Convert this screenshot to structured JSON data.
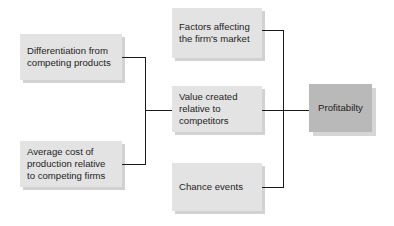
{
  "diagram": {
    "left_nodes": [
      {
        "label": "Differentiation from competing products"
      },
      {
        "label": "Average cost of production relative to competing firms"
      }
    ],
    "middle_nodes": [
      {
        "label": "Factors affecting the firm's market"
      },
      {
        "label": "Value created relative to competitors"
      },
      {
        "label": "Chance events"
      }
    ],
    "output_node": {
      "label": "Profitabilty"
    },
    "colors": {
      "box_fill": "#e3e3e3",
      "output_fill": "#b9b9b9",
      "connector": "#1a1a1a",
      "background": "#ffffff"
    }
  }
}
